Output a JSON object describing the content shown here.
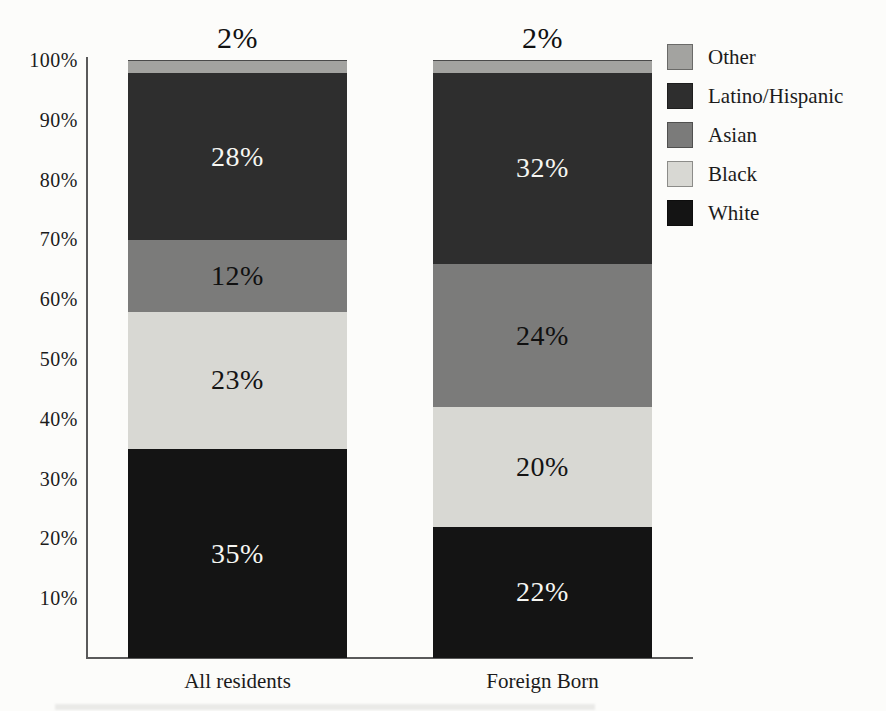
{
  "chart_data": {
    "type": "bar",
    "subtype": "stacked-100-percent",
    "orientation": "vertical",
    "categories": [
      "All residents",
      "Foreign Born"
    ],
    "series": [
      {
        "name": "White",
        "values": [
          35,
          22
        ],
        "color": "#141414",
        "label_color": "#f6f6f2",
        "label_position": "inside"
      },
      {
        "name": "Black",
        "values": [
          23,
          20
        ],
        "color": "#d8d8d3",
        "label_color": "#141414",
        "label_position": "inside"
      },
      {
        "name": "Asian",
        "values": [
          12,
          24
        ],
        "color": "#7b7b7a",
        "label_color": "#101010",
        "label_position": "inside"
      },
      {
        "name": "Latino/Hispanic",
        "values": [
          28,
          32
        ],
        "color": "#2e2e2e",
        "label_color": "#f6f6f2",
        "label_position": "inside"
      },
      {
        "name": "Other",
        "values": [
          2,
          2
        ],
        "color": "#a3a3a0",
        "label_color": "#141414",
        "label_position": "above"
      }
    ],
    "value_suffix": "%",
    "y_axis": {
      "min": 0,
      "max": 100,
      "gridlines": false,
      "ticks": [
        {
          "label": "100%",
          "value": 100
        },
        {
          "label": "90%",
          "value": 90
        },
        {
          "label": "80%",
          "value": 80
        },
        {
          "label": "70%",
          "value": 70
        },
        {
          "label": "60%",
          "value": 60
        },
        {
          "label": "50%",
          "value": 50
        },
        {
          "label": "40%",
          "value": 40
        },
        {
          "label": "30%",
          "value": 30
        },
        {
          "label": "20%",
          "value": 20
        },
        {
          "label": "10%",
          "value": 10
        }
      ]
    },
    "legend": {
      "position": "top-right",
      "entries": [
        "Other",
        "Latino/Hispanic",
        "Asian",
        "Black",
        "White"
      ]
    },
    "title": "",
    "xlabel": "",
    "ylabel": ""
  },
  "colors": {
    "background": "#fcfcfa",
    "axis": "#5a5a5a",
    "text": "#1b1b1b"
  }
}
